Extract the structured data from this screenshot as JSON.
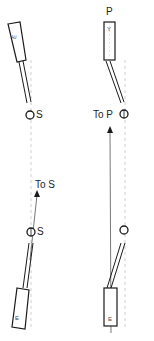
{
  "diagram": {
    "left_panel": {
      "top_block_label": "E",
      "top_pivot_label": "S",
      "arrow_label": "To S",
      "bottom_pivot_label": "S",
      "bottom_block_label": "E"
    },
    "right_panel": {
      "top_label": "P",
      "top_block_label": "Y",
      "arrow_label": "To P",
      "bottom_block_label": "E"
    },
    "colors": {
      "stroke": "#1a1a1a",
      "guide_line": "#bbbbbb",
      "background": "#ffffff"
    }
  }
}
